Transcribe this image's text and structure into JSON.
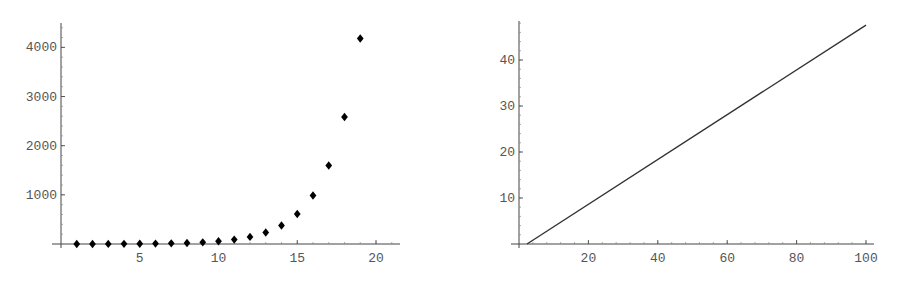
{
  "chart_data": [
    {
      "type": "scatter",
      "title": "",
      "xlabel": "",
      "ylabel": "",
      "marker": "diamond",
      "color": "#000000",
      "x": [
        1,
        2,
        3,
        4,
        5,
        6,
        7,
        8,
        9,
        10,
        11,
        12,
        13,
        14,
        15,
        16,
        17,
        18,
        19
      ],
      "y": [
        1,
        1,
        2,
        3,
        5,
        8,
        13,
        21,
        34,
        55,
        89,
        144,
        233,
        377,
        610,
        987,
        1597,
        2584,
        4181
      ],
      "xticks": [
        5,
        10,
        15,
        20
      ],
      "yticks": [
        1000,
        2000,
        3000,
        4000
      ],
      "xlim": [
        0,
        21.5
      ],
      "ylim": [
        0,
        4500
      ],
      "grid": false,
      "legend": null
    },
    {
      "type": "line",
      "title": "",
      "xlabel": "",
      "ylabel": "",
      "color": "#333333",
      "x": [
        2.3,
        100
      ],
      "y": [
        0,
        47.6
      ],
      "xticks": [
        20,
        40,
        60,
        80,
        100
      ],
      "yticks": [
        10,
        20,
        30,
        40
      ],
      "xlim": [
        0,
        102
      ],
      "ylim": [
        0,
        48.5
      ],
      "grid": false,
      "legend": null
    }
  ],
  "labels": {
    "left_x": [
      "5",
      "10",
      "15",
      "20"
    ],
    "left_y": [
      "1000",
      "2000",
      "3000",
      "4000"
    ],
    "right_x": [
      "20",
      "40",
      "60",
      "80",
      "100"
    ],
    "right_y": [
      "10",
      "20",
      "30",
      "40"
    ]
  }
}
